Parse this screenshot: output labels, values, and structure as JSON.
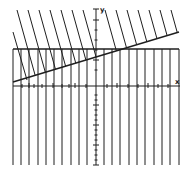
{
  "chart_data": {
    "type": "line",
    "title": "",
    "xlabel": "x",
    "ylabel": "y",
    "grid": false,
    "legend": [],
    "axes": {
      "origin_px": [
        96,
        86
      ],
      "x_axis": {
        "x1": 13,
        "x2": 180,
        "y": 86
      },
      "y_axis": {
        "x": 96,
        "y1": 9,
        "y2": 165
      },
      "x_ticks_px": [
        22,
        29,
        34,
        42,
        53,
        62,
        69,
        75,
        86,
        107,
        117,
        128,
        138,
        148,
        158,
        168
      ],
      "y_ticks_px": [
        20,
        30,
        40,
        50,
        60,
        70,
        95,
        100,
        105,
        110,
        115,
        120,
        125,
        130,
        135,
        140,
        145,
        150,
        155,
        160,
        165
      ]
    },
    "boundaries": [
      {
        "name": "sloped-boundary",
        "x1": 13,
        "y1": 82,
        "x2": 179,
        "y2": 32,
        "shading": "above",
        "hatch": "diagonal"
      },
      {
        "name": "horizontal-boundary",
        "x1": 13,
        "y1": 49,
        "x2": 179,
        "y2": 49,
        "shading": "below",
        "hatch": "vertical"
      }
    ],
    "vertical_hatch_x": [
      13,
      21,
      29,
      38,
      46,
      54,
      62,
      71,
      79,
      87,
      104,
      112,
      120,
      129,
      137,
      145,
      154,
      162,
      170,
      179
    ],
    "vertical_hatch_y": [
      49,
      165
    ],
    "diagonal_hatch_tops": [
      17,
      28,
      39,
      50,
      61,
      72,
      83,
      105,
      116,
      127,
      138,
      149,
      160,
      171
    ],
    "diagonal_hatch_top_y": 10,
    "diagonal_slope": 3.6,
    "extra_diagonal": {
      "x1": 13,
      "y1": 32,
      "x2": 27,
      "y2": 80
    },
    "line_color": "#1e1e1e",
    "background": "#ffffff"
  },
  "labels": {
    "x_axis": "x",
    "y_axis": "y"
  }
}
